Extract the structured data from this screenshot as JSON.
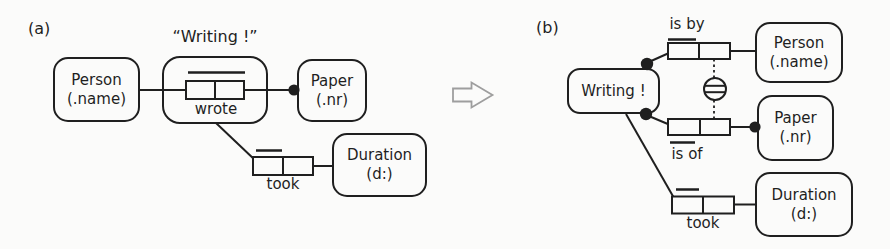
{
  "figure_type": "ORM objectification transformation diagram",
  "colors": {
    "ink": "#1f1f1f",
    "arrow_outline": "#9e9e9e",
    "background": "#fbfbfa"
  },
  "transform_arrow_icon": "hollow-right-arrow",
  "panel_a": {
    "label": "(a)",
    "objectified_caption": "“Writing !”",
    "person": {
      "name": "Person",
      "ref_mode": "(.name)"
    },
    "paper": {
      "name": "Paper",
      "ref_mode": "(.nr)"
    },
    "duration": {
      "name": "Duration",
      "ref_mode": "(d:)"
    },
    "wrote_label": "wrote",
    "took_label": "took"
  },
  "panel_b": {
    "label": "(b)",
    "writing": {
      "name": "Writing !"
    },
    "person": {
      "name": "Person",
      "ref_mode": "(.name)"
    },
    "paper": {
      "name": "Paper",
      "ref_mode": "(.nr)"
    },
    "duration": {
      "name": "Duration",
      "ref_mode": "(d:)"
    },
    "is_by_label": "is by",
    "is_of_label": "is of",
    "took_label": "took"
  }
}
